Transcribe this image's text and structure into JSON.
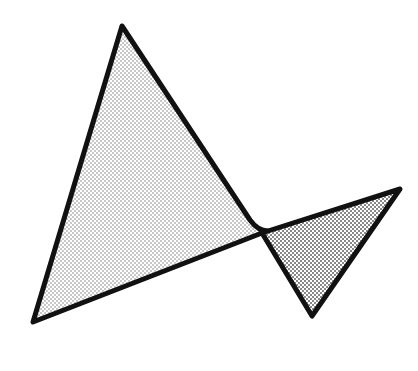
{
  "diagram": {
    "background": "#ffffff",
    "stroke_color": "#111111",
    "stroke_width": 5,
    "shapes": [
      {
        "name": "large-triangle",
        "points": "122,26 33,322 262,232 258,228",
        "fill_pattern": "fine-dots",
        "dot_color": "#777777"
      },
      {
        "name": "small-triangle",
        "points": "262,232 400,189 312,316",
        "fill_pattern": "dense-dots",
        "dot_color": "#555555"
      }
    ]
  }
}
